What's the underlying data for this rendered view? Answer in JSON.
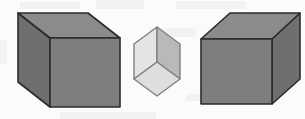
{
  "figure": {
    "description": "Two large dark gray cubes shown in oblique projection flanking one small light gray cube viewed corner-on",
    "background_color": "#fbfbfa",
    "outline_color": "#2b2b2b",
    "scan_artifact_color": "#f2f1ee"
  },
  "objects": [
    {
      "id": "left-cube",
      "name": "left-large-cube",
      "view": "three-quarter-left",
      "outline_color": "#2b2b2b",
      "outline_width": 1.6,
      "faces": {
        "front": {
          "label": "front-face",
          "color": "#7e7e7e",
          "points": "50,38 120,38 120,107 50,107"
        },
        "top": {
          "label": "top-face",
          "color": "#8b8b8b",
          "points": "50,38 18,13 88,13 120,38"
        },
        "left": {
          "label": "left-side-face",
          "color": "#6f6f6f",
          "points": "18,13 50,38 50,107 18,82"
        }
      }
    },
    {
      "id": "middle-cube",
      "name": "middle-small-cube",
      "view": "corner-on",
      "outline_color": "#808080",
      "outline_width": 1.4,
      "faces": {
        "top_left": {
          "label": "upper-left-face",
          "color": "#e4e4e2",
          "points": "134,44 157,27 157,62 134,79"
        },
        "top_right": {
          "label": "upper-right-face",
          "color": "#b9b9b7",
          "points": "157,27 180,44 180,79 157,62"
        },
        "bottom": {
          "label": "lower-front-face",
          "color": "#dedede",
          "points": "157,62 180,79 157,96 134,79"
        }
      }
    },
    {
      "id": "right-cube",
      "name": "right-large-cube",
      "view": "three-quarter-right",
      "outline_color": "#2b2b2b",
      "outline_width": 1.6,
      "faces": {
        "front": {
          "label": "front-face",
          "color": "#7e7e7e",
          "points": "201,39 272,39 272,104 201,104"
        },
        "top": {
          "label": "top-face",
          "color": "#8b8b8b",
          "points": "201,39 230,13 300,13 272,39"
        },
        "right": {
          "label": "right-side-face",
          "color": "#6f6f6f",
          "points": "272,39 300,13 300,79 272,104"
        }
      }
    }
  ],
  "scan_artifacts": [
    {
      "x": 20,
      "y": 2,
      "w": 60,
      "h": 7
    },
    {
      "x": 96,
      "y": 0,
      "w": 48,
      "h": 9
    },
    {
      "x": 176,
      "y": 1,
      "w": 70,
      "h": 8
    },
    {
      "x": 150,
      "y": 28,
      "w": 46,
      "h": 9
    },
    {
      "x": 0,
      "y": 40,
      "w": 7,
      "h": 24
    },
    {
      "x": 186,
      "y": 94,
      "w": 40,
      "h": 7
    },
    {
      "x": 60,
      "y": 112,
      "w": 96,
      "h": 7
    }
  ]
}
